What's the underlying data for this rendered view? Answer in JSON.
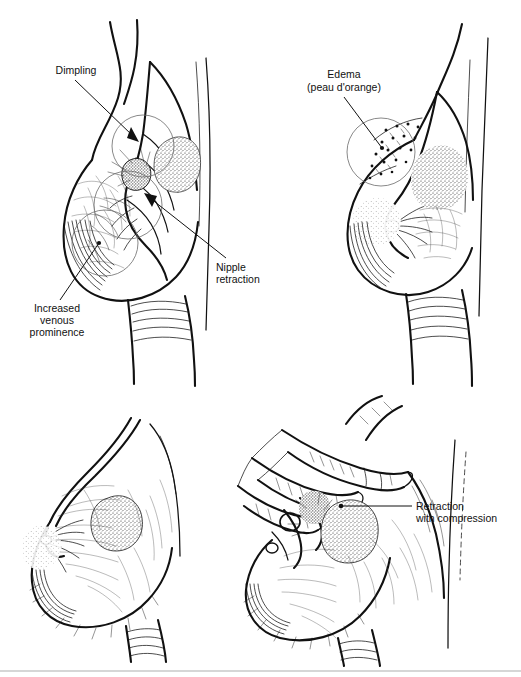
{
  "figure": {
    "background_color": "#ffffff",
    "ink_color": "#111111",
    "highlight_circle_color": "#6b6b6b",
    "divider_color": "#c9c9c9",
    "width": 521,
    "height": 677
  },
  "panels": [
    {
      "id": "top-left",
      "position": "top-left",
      "description": "Breast in lateral profile showing dimpling, nipple retraction and increased venous prominence",
      "labels": [
        "dimpling",
        "nipple_retraction",
        "increased_venous_prominence"
      ]
    },
    {
      "id": "top-right",
      "position": "top-right",
      "description": "Breast in lateral profile showing edema with peau d'orange pitted skin",
      "labels": [
        "edema"
      ]
    },
    {
      "id": "bottom-left",
      "position": "bottom-left",
      "description": "Breast in lateral profile with underlying tumor mass, no label",
      "labels": []
    },
    {
      "id": "bottom-right",
      "position": "bottom-right",
      "description": "Hand compressing breast producing retraction over the tumor",
      "labels": [
        "retraction_with_compression"
      ]
    }
  ],
  "labels": {
    "dimpling": {
      "lines": [
        "Dimpling"
      ],
      "align": "center",
      "leader": "arrow"
    },
    "nipple_retraction": {
      "lines": [
        "Nipple",
        "retraction"
      ],
      "align": "left",
      "leader": "arrow"
    },
    "increased_venous_prominence": {
      "lines": [
        "Increased",
        "venous",
        "prominence"
      ],
      "align": "center",
      "leader": "dot"
    },
    "edema": {
      "lines": [
        "Edema",
        "(peau d'orange)"
      ],
      "align": "center",
      "leader": "dot"
    },
    "retraction_with_compression": {
      "lines": [
        "Retraction",
        "with compression"
      ],
      "align": "left",
      "leader": "line"
    }
  },
  "label_text": {
    "dimpling_l1": "Dimpling",
    "nipple_l1": "Nipple",
    "nipple_l2": "retraction",
    "venous_l1": "Increased",
    "venous_l2": "venous",
    "venous_l3": "prominence",
    "edema_l1": "Edema",
    "edema_l2": "(peau d'orange)",
    "retraction_l1": "Retraction",
    "retraction_l2": "with compression"
  }
}
